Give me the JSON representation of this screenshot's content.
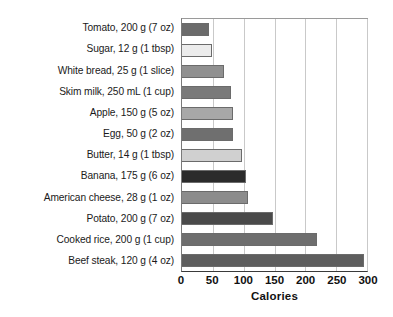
{
  "chart_data": {
    "type": "bar",
    "orientation": "horizontal",
    "title": "",
    "xlabel": "Calories",
    "ylabel": "",
    "xlim": [
      0,
      300
    ],
    "xticks": [
      0,
      50,
      100,
      150,
      200,
      250,
      300
    ],
    "xtick_labels": [
      "0",
      "50",
      "100",
      "150",
      "200",
      "250",
      "300"
    ],
    "grid": "vertical",
    "legend": "none",
    "categories": [
      "Tomato, 200 g (7 oz)",
      "Sugar, 12 g (1 tbsp)",
      "White bread, 25 g (1 slice)",
      "Skim milk, 250 mL (1 cup)",
      "Apple, 150 g (5 oz)",
      "Egg, 50 g (2 oz)",
      "Butter, 14 g (1 tbsp)",
      "Banana, 175 g (6 oz)",
      "American cheese, 28 g (1 oz)",
      "Potato, 200 g (7 oz)",
      "Cooked rice, 200 g (1 cup)",
      "Beef steak, 120 g (4 oz)"
    ],
    "values": [
      44,
      48,
      68,
      80,
      82,
      82,
      98,
      103,
      107,
      147,
      219,
      295
    ],
    "bar_colors": [
      "#6b6b6b",
      "#ececec",
      "#909090",
      "#7a7a7a",
      "#a8a8a8",
      "#6f6f6f",
      "#d0d0d0",
      "#2b2b2b",
      "#8c8c8c",
      "#4a4a4a",
      "#6e6e6e",
      "#5e5e5e"
    ]
  },
  "colors": {
    "background": "#ffffff",
    "gridline": "#c9c9c9",
    "axis": "#3a3a3a",
    "text": "#111111"
  }
}
